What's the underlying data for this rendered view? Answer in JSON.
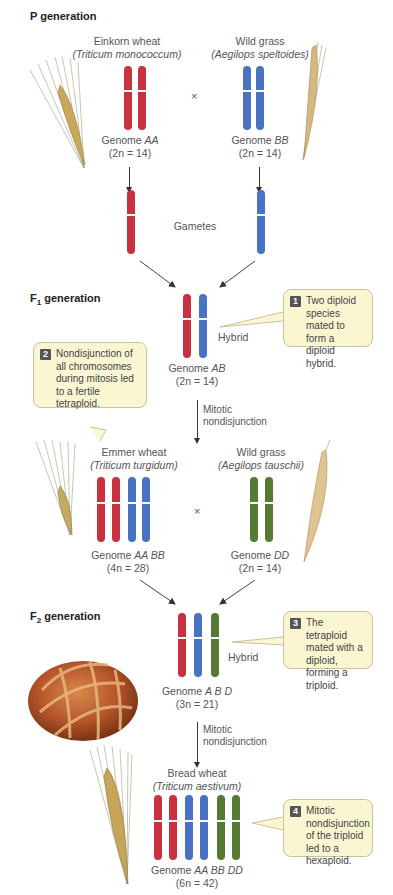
{
  "generations": {
    "p": "P generation",
    "f1": "F",
    "f1_sub": "1",
    "f1_rest": " generation",
    "f2": "F",
    "f2_sub": "2",
    "f2_rest": " generation"
  },
  "p_left": {
    "name": "Einkorn wheat",
    "species": "(Triticum monococcum)",
    "genome_prefix": "Genome ",
    "genome": "AA",
    "count": "(2n = 14)"
  },
  "p_right": {
    "name": "Wild grass",
    "species": "(Aegilops speltoides)",
    "genome_prefix": "Genome ",
    "genome": "BB",
    "count": "(2n = 14)"
  },
  "cross_symbol": "×",
  "gametes": "Gametes",
  "f1_hybrid": {
    "label": "Hybrid",
    "genome_prefix": "Genome ",
    "genome": "AB",
    "count": "(2n = 14)"
  },
  "mitotic_1": [
    "Mitotic",
    "nondisjunction"
  ],
  "emmer": {
    "name": "Emmer wheat",
    "species": "(Triticum turgidum)",
    "genome_prefix": "Genome ",
    "genome": "AA BB",
    "count": "(4n = 28)"
  },
  "tauschii": {
    "name": "Wild grass",
    "species": "(Aegilops tauschii)",
    "genome_prefix": "Genome ",
    "genome": "DD",
    "count": "(2n = 14)"
  },
  "f2_hybrid": {
    "label": "Hybrid",
    "genome_prefix": "Genome ",
    "genome": "A B D",
    "count": "(3n = 21)"
  },
  "mitotic_2": [
    "Mitotic",
    "nondisjunction"
  ],
  "bread": {
    "name": "Bread wheat",
    "species": "(Triticum aestivum)",
    "genome_prefix": "Genome ",
    "genome": "AA BB DD",
    "count": "(6n = 42)"
  },
  "callouts": [
    {
      "num": "1",
      "text": "Two diploid species mated to form a diploid hybrid."
    },
    {
      "num": "2",
      "text": "Nondisjunction of all chromosomes during mitosis led to a fertile tetraploid."
    },
    {
      "num": "3",
      "text": "The tetraploid mated with a diploid, forming a triploid."
    },
    {
      "num": "4",
      "text": "Mitotic nondisjunction of the triploid led to a hexaploid."
    }
  ],
  "colors": {
    "genome_a": "#c8323e",
    "genome_b": "#4a72c2",
    "genome_d": "#557a33",
    "callout_bg": "#fbf6d2"
  }
}
